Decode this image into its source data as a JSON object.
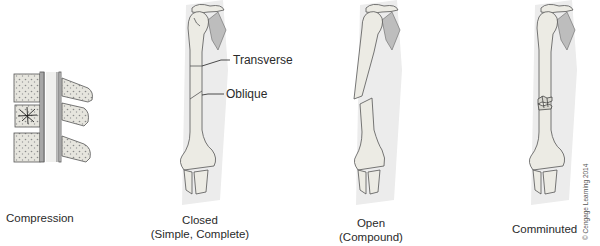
{
  "figure": {
    "panels": [
      {
        "id": "compression",
        "caption_line1": "Compression",
        "caption_line2": ""
      },
      {
        "id": "closed",
        "caption_line1": "Closed",
        "caption_line2": "(Simple, Complete)",
        "callouts": [
          {
            "text": "Transverse"
          },
          {
            "text": "Oblique"
          }
        ]
      },
      {
        "id": "open",
        "caption_line1": "Open",
        "caption_line2": "(Compound)"
      },
      {
        "id": "comminuted",
        "caption_line1": "Comminuted",
        "caption_line2": ""
      }
    ],
    "credit": "© Cengage Learning 2014",
    "colors": {
      "bone_fill": "#ecebe4",
      "bone_line": "#555555",
      "shadow": "#d9d9d9",
      "scapula": "#bdbdbd"
    }
  }
}
